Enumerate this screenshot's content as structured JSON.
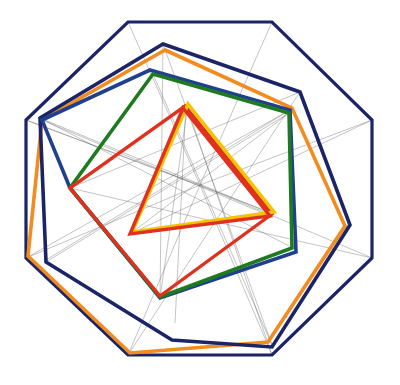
{
  "diagram": {
    "type": "nested-polygons",
    "colors": {
      "navy": "#1a2466",
      "blue": "#1f3f8f",
      "orange": "#f28c1e",
      "green": "#1e7a1e",
      "red": "#e0301e",
      "yellow": "#f5c400",
      "construction": "#555555"
    },
    "polygons": [
      {
        "name": "octagon",
        "color": "navy",
        "width": 3.2,
        "points": "128,22 272,22 372,120 372,258 272,355 128,355 26,258 26,120"
      },
      {
        "name": "heptagon-orange",
        "color": "orange",
        "width": 3.6,
        "points": "165,50 292,108 345,226 268,342 130,353 28,256 42,120"
      },
      {
        "name": "heptagon-navy",
        "color": "navy",
        "width": 3.6,
        "points": "163,44 300,92 350,225 272,347 172,340 46,262 40,118"
      },
      {
        "name": "hexagon-blue",
        "color": "blue",
        "width": 3.6,
        "points": "150,70 290,110 296,252 160,298 70,188 42,120"
      },
      {
        "name": "pentagon-green",
        "color": "green",
        "width": 3.6,
        "points": "153,74 289,113 292,248 160,297 70,188"
      },
      {
        "name": "square-red",
        "color": "red",
        "width": 3.4,
        "points": "185,106 272,214 160,296 70,188"
      },
      {
        "name": "triangle-yellow",
        "color": "yellow",
        "width": 3.6,
        "points": "188,104 274,212 132,232"
      },
      {
        "name": "triangle-red",
        "color": "red",
        "width": 3.4,
        "points": "183,108 130,234 270,216"
      }
    ],
    "construction_lines": [
      [
        128,
        22,
        200,
        185
      ],
      [
        272,
        22,
        200,
        185
      ],
      [
        372,
        120,
        200,
        185
      ],
      [
        372,
        258,
        200,
        185
      ],
      [
        272,
        355,
        200,
        185
      ],
      [
        128,
        355,
        200,
        185
      ],
      [
        26,
        258,
        200,
        185
      ],
      [
        26,
        120,
        200,
        185
      ],
      [
        40,
        118,
        272,
        214
      ],
      [
        40,
        118,
        293,
        248
      ],
      [
        46,
        262,
        289,
        113
      ],
      [
        70,
        188,
        372,
        258
      ],
      [
        160,
        298,
        188,
        104
      ],
      [
        163,
        44,
        272,
        345
      ],
      [
        300,
        92,
        128,
        355
      ],
      [
        186,
        104,
        272,
        355
      ],
      [
        70,
        188,
        300,
        92
      ],
      [
        130,
        234,
        372,
        120
      ],
      [
        272,
        213,
        26,
        120
      ],
      [
        160,
        298,
        163,
        44
      ],
      [
        152,
        72,
        272,
        345
      ],
      [
        290,
        110,
        46,
        260
      ],
      [
        26,
        258,
        290,
        110
      ],
      [
        175,
        323,
        186,
        104
      ],
      [
        270,
        216,
        42,
        120
      ],
      [
        130,
        234,
        289,
        113
      ]
    ]
  }
}
